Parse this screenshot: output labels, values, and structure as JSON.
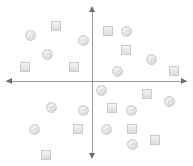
{
  "diagram": {
    "type": "quadrant-scatter",
    "axes": {
      "horizontal": {
        "arrows": "both",
        "y": 81
      },
      "vertical": {
        "arrows": "both",
        "x": 92
      }
    },
    "colors": {
      "axis": "#9a9a9a",
      "arrowhead": "#6d6d6d",
      "marker_fill": "#e4e4e4",
      "marker_border": "#c9c9c9"
    },
    "circles": [
      {
        "x": 30,
        "y": 35
      },
      {
        "x": 47,
        "y": 54
      },
      {
        "x": 83,
        "y": 40
      },
      {
        "x": 126,
        "y": 31
      },
      {
        "x": 151,
        "y": 59
      },
      {
        "x": 117,
        "y": 71
      },
      {
        "x": 101,
        "y": 90
      },
      {
        "x": 169,
        "y": 101
      },
      {
        "x": 51,
        "y": 107
      },
      {
        "x": 83,
        "y": 110
      },
      {
        "x": 131,
        "y": 110
      },
      {
        "x": 34,
        "y": 129
      },
      {
        "x": 106,
        "y": 129
      },
      {
        "x": 132,
        "y": 144
      }
    ],
    "squares": [
      {
        "x": 56,
        "y": 26
      },
      {
        "x": 108,
        "y": 31
      },
      {
        "x": 126,
        "y": 50
      },
      {
        "x": 25,
        "y": 67
      },
      {
        "x": 74,
        "y": 67
      },
      {
        "x": 174,
        "y": 71
      },
      {
        "x": 147,
        "y": 94
      },
      {
        "x": 112,
        "y": 108
      },
      {
        "x": 78,
        "y": 129
      },
      {
        "x": 132,
        "y": 129
      },
      {
        "x": 155,
        "y": 140
      },
      {
        "x": 46,
        "y": 155
      }
    ]
  }
}
